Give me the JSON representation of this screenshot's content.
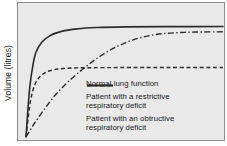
{
  "chart_data": {
    "type": "line",
    "title": "",
    "xlabel": "",
    "ylabel": "Volume (litres)",
    "xlim": [
      0,
      1
    ],
    "ylim": [
      0,
      1
    ],
    "grid": false,
    "legend_position": "inside-lower-right",
    "axis_ticks": {
      "x": [],
      "y": []
    },
    "series": [
      {
        "name": "Normal lung function",
        "style": "solid",
        "color": "#2b2b2b",
        "plateau_value": 0.86,
        "rise_rate": "fast",
        "points": [
          [
            0.0,
            0.0
          ],
          [
            0.01,
            0.22
          ],
          [
            0.02,
            0.4
          ],
          [
            0.035,
            0.56
          ],
          [
            0.05,
            0.66
          ],
          [
            0.08,
            0.74
          ],
          [
            0.12,
            0.79
          ],
          [
            0.18,
            0.825
          ],
          [
            0.26,
            0.845
          ],
          [
            0.36,
            0.855
          ],
          [
            0.5,
            0.86
          ],
          [
            0.7,
            0.862
          ],
          [
            1.0,
            0.863
          ]
        ]
      },
      {
        "name": "Patient with a restrictive respiratory deficit",
        "style": "dashed",
        "color": "#2b2b2b",
        "plateau_value": 0.54,
        "rise_rate": "fast",
        "points": [
          [
            0.0,
            0.0
          ],
          [
            0.012,
            0.16
          ],
          [
            0.025,
            0.3
          ],
          [
            0.045,
            0.41
          ],
          [
            0.07,
            0.47
          ],
          [
            0.1,
            0.505
          ],
          [
            0.14,
            0.525
          ],
          [
            0.19,
            0.535
          ],
          [
            0.26,
            0.54
          ],
          [
            0.4,
            0.542
          ],
          [
            0.6,
            0.543
          ],
          [
            1.0,
            0.543
          ]
        ]
      },
      {
        "name": "Patient with an obtructive respiratory deficit",
        "style": "dashdot",
        "color": "#2b2b2b",
        "plateau_value": 0.82,
        "rise_rate": "slow",
        "points": [
          [
            0.0,
            0.0
          ],
          [
            0.04,
            0.1
          ],
          [
            0.09,
            0.21
          ],
          [
            0.15,
            0.33
          ],
          [
            0.22,
            0.44
          ],
          [
            0.3,
            0.545
          ],
          [
            0.38,
            0.635
          ],
          [
            0.46,
            0.705
          ],
          [
            0.54,
            0.757
          ],
          [
            0.62,
            0.79
          ],
          [
            0.7,
            0.808
          ],
          [
            0.78,
            0.816
          ],
          [
            0.86,
            0.82
          ],
          [
            1.0,
            0.822
          ]
        ]
      }
    ]
  },
  "legend": {
    "items": [
      {
        "sample": "solid-line-sample",
        "line1": "Normal lung function",
        "line2": ""
      },
      {
        "sample": "dashed-line-sample",
        "line1": "Patient with a restrictive",
        "line2": "respiratory deficit"
      },
      {
        "sample": "dashdot-line-sample",
        "line1": "Patient with an obtructive",
        "line2": "respiratory deficit"
      }
    ]
  },
  "colors": {
    "plot_background": "#e9e9e9",
    "plot_border": "#8d8d8d",
    "line": "#2b2b2b",
    "text": "#17171a"
  }
}
